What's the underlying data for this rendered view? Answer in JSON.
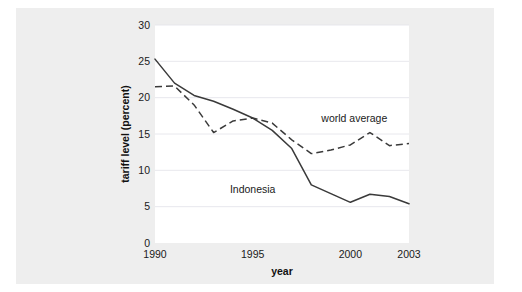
{
  "chart_data": {
    "type": "line",
    "title": "",
    "xlabel": "year",
    "ylabel": "tariff level (percent)",
    "xlim": [
      1990,
      2003
    ],
    "ylim": [
      0,
      30
    ],
    "x": [
      1990,
      1991,
      1992,
      1993,
      1994,
      1995,
      1996,
      1997,
      1998,
      1999,
      2000,
      2001,
      2002,
      2003
    ],
    "xticks": [
      1990,
      1995,
      2000,
      2003
    ],
    "xticklabels": [
      "1990",
      "1995",
      "2000",
      "2003"
    ],
    "yticks": [
      0,
      5,
      10,
      15,
      20,
      25,
      30
    ],
    "yticklabels": [
      "0",
      "5",
      "10",
      "15",
      "20",
      "25",
      "30"
    ],
    "grid": "horizontal",
    "legend_position": "inline-annotations",
    "series": [
      {
        "name": "Indonesia",
        "style": "solid",
        "color": "#3a3a3a",
        "label_x": 1995.0,
        "label_y": 6.9,
        "values": [
          25.3,
          22.0,
          20.3,
          19.5,
          18.4,
          17.2,
          15.5,
          13.0,
          8.0,
          6.8,
          5.6,
          6.7,
          6.4,
          5.4
        ]
      },
      {
        "name": "world average",
        "style": "dashed",
        "color": "#3a3a3a",
        "label_x": 2000.2,
        "label_y": 16.6,
        "values": [
          21.5,
          21.6,
          19.0,
          15.2,
          16.8,
          17.2,
          16.5,
          14.2,
          12.3,
          12.8,
          13.5,
          15.2,
          13.4,
          13.7
        ]
      }
    ],
    "annotations": [
      {
        "text": "Indonesia",
        "x": 1995.0,
        "y": 6.9
      },
      {
        "text": "world average",
        "x": 2000.2,
        "y": 16.6
      }
    ]
  },
  "figure": {
    "panel_color": "#eeeeee",
    "plot_background": "#ffffff",
    "gridline_color": "#e2e2e8",
    "text_color": "#1a1a1a"
  }
}
